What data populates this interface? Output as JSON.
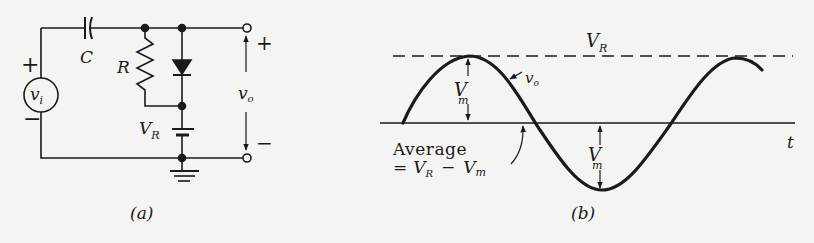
{
  "figure_a": {
    "caption": "(a)",
    "source": {
      "label_main": "v",
      "label_sub": "i",
      "plus": "+",
      "minus": "−"
    },
    "capacitor": {
      "label": "C"
    },
    "resistor": {
      "label": "R"
    },
    "battery": {
      "label_main": "V",
      "label_sub": "R"
    },
    "output": {
      "label_main": "v",
      "label_sub": "o",
      "plus": "+",
      "minus": "−"
    }
  },
  "figure_b": {
    "caption": "(b)",
    "ref_level": {
      "label_main": "V",
      "label_sub": "R"
    },
    "signal": {
      "label_main": "v",
      "label_sub": "o"
    },
    "amplitude_top": {
      "label_main": "V",
      "label_sub": "m"
    },
    "amplitude_bottom": {
      "label_main": "V",
      "label_sub": "m"
    },
    "axis": {
      "label": "t"
    },
    "average": {
      "line1": "Average",
      "eq": "=",
      "vr_main": "V",
      "vr_sub": "R",
      "minus": "−",
      "vm_main": "V",
      "vm_sub": "m"
    }
  }
}
